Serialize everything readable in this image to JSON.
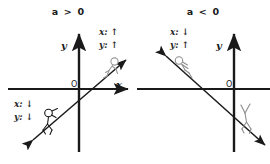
{
  "figure": {
    "title": "",
    "background_color": "#ffffff",
    "ink_color": "#1a1a1a",
    "figure_color": "#9a9a9a"
  },
  "panels": [
    {
      "id": "positive-slope",
      "condition_label": "a > 0",
      "axes": {
        "y_axis_label": "y",
        "x_axis_label": "x",
        "origin_label": "O"
      },
      "line": {
        "slope_sign": "positive",
        "direction": "up-right"
      },
      "annotations": [
        {
          "id": "upper-right",
          "x_var": "x",
          "x_arrow": "↑",
          "y_var": "y",
          "y_arrow": "↑",
          "x_line": "x: ↑",
          "y_line": "y: ↑"
        },
        {
          "id": "lower-left",
          "x_var": "x",
          "x_arrow": "↓",
          "y_var": "y",
          "y_arrow": "↓",
          "x_line": "x: ↓",
          "y_line": "y: ↓"
        }
      ],
      "figures": [
        {
          "id": "climber-upper",
          "position": "upper-right",
          "motion": "climbing-up"
        },
        {
          "id": "climber-lower",
          "position": "lower-left",
          "motion": "descending"
        }
      ]
    },
    {
      "id": "negative-slope",
      "condition_label": "a < 0",
      "axes": {
        "y_axis_label": "y",
        "x_axis_label": "",
        "origin_label": "O"
      },
      "line": {
        "slope_sign": "negative",
        "direction": "down-right"
      },
      "annotations": [
        {
          "id": "upper-left",
          "x_var": "x",
          "x_arrow": "↓",
          "y_var": "y",
          "y_arrow": "↑",
          "x_line": "x: ↓",
          "y_line": "y: ↑"
        }
      ],
      "figures": [
        {
          "id": "climber-upper",
          "position": "upper-left",
          "motion": "climbing-up-left"
        },
        {
          "id": "climber-lower",
          "position": "lower-right",
          "motion": "descending"
        }
      ]
    }
  ]
}
